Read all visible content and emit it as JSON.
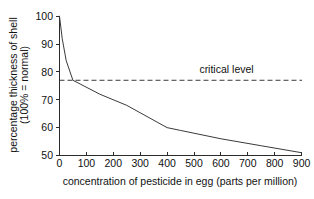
{
  "chart_data": {
    "type": "line",
    "title": "",
    "subtitle": "",
    "xlabel": "concentration of pesticide in egg (parts per million)",
    "ylabel": "percentage thickness of shell (100% = normal)",
    "ylabel_line1": "percentage thickness of shell",
    "ylabel_line2": "(100% = normal)",
    "xlim": [
      0,
      900
    ],
    "ylim": [
      50,
      100
    ],
    "grid": false,
    "legend": "none",
    "xticks": [
      0,
      100,
      200,
      300,
      400,
      500,
      600,
      700,
      800,
      900
    ],
    "xtick_labels": [
      "0",
      "100",
      "200",
      "300",
      "400",
      "500",
      "600",
      "700",
      "800",
      "900"
    ],
    "yticks": [
      50,
      60,
      70,
      80,
      90,
      100
    ],
    "ytick_labels": [
      "50",
      "60",
      "70",
      "80",
      "90",
      "100"
    ],
    "series": [
      {
        "name": "shell thickness",
        "color": "#3a3a3a",
        "style": "solid",
        "x": [
          0,
          10,
          25,
          50,
          150,
          250,
          400,
          450,
          600,
          750,
          900
        ],
        "values": [
          100,
          92,
          84,
          77,
          72,
          68,
          60,
          59,
          56,
          53.5,
          51
        ]
      }
    ],
    "annotations": [
      {
        "name": "critical-level",
        "label": "critical level",
        "type": "hline",
        "y": 77,
        "style": "dashed",
        "color": "#3a3a3a",
        "label_x": 520,
        "label_y": 79.5
      }
    ]
  },
  "axes": {
    "x_axis_name": "x-axis",
    "y_axis_name": "y-axis"
  }
}
